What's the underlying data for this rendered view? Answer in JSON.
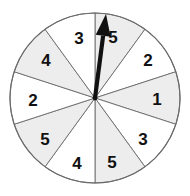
{
  "figure": {
    "type": "spinner-wheel",
    "title": "",
    "background_color": "#ffffff"
  },
  "chart_data": {
    "type": "pie",
    "title": "",
    "xlabel": "",
    "ylabel": "",
    "legend_position": "none",
    "grid": false,
    "center": {
      "x": 95,
      "y": 98
    },
    "radius": 85,
    "sector_count": 10,
    "sector_angle_degrees": 36,
    "categories": [
      "5",
      "2",
      "1",
      "3",
      "5",
      "4",
      "5",
      "2",
      "4",
      "3"
    ],
    "values": [
      36,
      36,
      36,
      36,
      36,
      36,
      36,
      36,
      36,
      36
    ],
    "sectors": [
      {
        "index": 0,
        "label": "5",
        "start_deg": -90,
        "end_deg": -54,
        "fill": "#ededed",
        "shaded": true,
        "label_x": 113,
        "label_y": 37
      },
      {
        "index": 1,
        "label": "2",
        "start_deg": -54,
        "end_deg": -18,
        "fill": "#ffffff",
        "shaded": false,
        "label_x": 148,
        "label_y": 60
      },
      {
        "index": 2,
        "label": "1",
        "start_deg": -18,
        "end_deg": 18,
        "fill": "#ededed",
        "shaded": true,
        "label_x": 157,
        "label_y": 99
      },
      {
        "index": 3,
        "label": "3",
        "start_deg": 18,
        "end_deg": 54,
        "fill": "#ffffff",
        "shaded": false,
        "label_x": 143,
        "label_y": 139
      },
      {
        "index": 4,
        "label": "5",
        "start_deg": 54,
        "end_deg": 90,
        "fill": "#ededed",
        "shaded": true,
        "label_x": 112,
        "label_y": 162
      },
      {
        "index": 5,
        "label": "4",
        "start_deg": 90,
        "end_deg": 126,
        "fill": "#ffffff",
        "shaded": false,
        "label_x": 77,
        "label_y": 163
      },
      {
        "index": 6,
        "label": "5",
        "start_deg": 126,
        "end_deg": 162,
        "fill": "#ededed",
        "shaded": true,
        "label_x": 45,
        "label_y": 139
      },
      {
        "index": 7,
        "label": "2",
        "start_deg": 162,
        "end_deg": 198,
        "fill": "#ffffff",
        "shaded": false,
        "label_x": 33,
        "label_y": 100
      },
      {
        "index": 8,
        "label": "4",
        "start_deg": 198,
        "end_deg": 234,
        "fill": "#ededed",
        "shaded": true,
        "label_x": 46,
        "label_y": 60
      },
      {
        "index": 9,
        "label": "3",
        "start_deg": 234,
        "end_deg": 270,
        "fill": "#ffffff",
        "shaded": false,
        "label_x": 79,
        "label_y": 38
      }
    ],
    "colors": {
      "shaded_fill": "#ededed",
      "unshaded_fill": "#ffffff",
      "outline": "#6b6b6b",
      "spoke": "#6b6b6b",
      "pointer": "#111111",
      "label_text": "#111111"
    },
    "pointer": {
      "label": "spinner-arrow",
      "pivot_x": 95,
      "pivot_y": 98,
      "tip_x": 106,
      "tip_y": 14,
      "points_to_sector_index": 0,
      "points_to_value": "5",
      "angle_from_vertical_deg": 7
    }
  }
}
